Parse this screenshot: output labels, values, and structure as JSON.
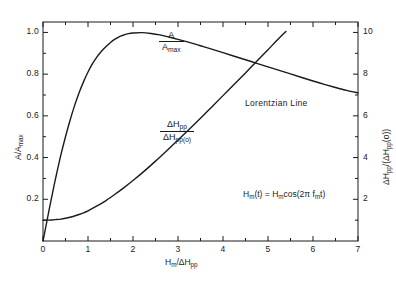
{
  "figure": {
    "background_color": "#ffffff",
    "line_color": "#1a1a1a",
    "annotation_note": "Lorentzian Line",
    "equation": {
      "lhs_symbol": "H",
      "lhs_sub": "m",
      "lhs_arg": "(t)",
      "equals": "=",
      "rhs_symbol": "H",
      "rhs_sub": "m",
      "rhs_fn": "cos(2π f",
      "rhs_fn_sub": "m",
      "rhs_tail": "t)",
      "full_text": "H_m(t) = H_m cos(2π f_m t)"
    },
    "axes": {
      "x": {
        "label_main": "H",
        "label_main_sub": "m",
        "label_sep": "/ΔH",
        "label_sep_sub": "pp",
        "label_full": "H_m /ΔH_pp",
        "ticks": [
          "0",
          "1",
          "2",
          "3",
          "4",
          "5",
          "6",
          "7"
        ]
      },
      "y_left": {
        "label_main": "A/A",
        "label_main_sub": "max",
        "label_full": "A/A_max",
        "ticks": [
          "0.2",
          "0.4",
          "0.6",
          "0.8",
          "1.0"
        ]
      },
      "y_right": {
        "label_num": "ΔH",
        "label_num_sub": "pp",
        "label_den": "/(ΔH",
        "label_den_sub": "pp",
        "label_tail": "(o))",
        "label_full": "ΔH_pp /(ΔH_pp(o))",
        "ticks": [
          "2",
          "4",
          "6",
          "8",
          "10"
        ]
      }
    },
    "curve_labels": {
      "amplitude": {
        "numerator": "A",
        "denominator_main": "A",
        "denominator_sub": "max",
        "full": "A/A_max"
      },
      "linewidth": {
        "numerator_main": "ΔH",
        "numerator_sub": "pp",
        "denominator_main": "ΔH",
        "denominator_sub": "pp",
        "denominator_tail": "(o)",
        "full": "ΔH_pp/ΔH_pp(o)"
      }
    }
  },
  "chart_data": {
    "type": "line",
    "title": "",
    "subtitle": "",
    "annotations": [
      "Lorentzian Line",
      "H_m(t) = H_m cos(2π f_m t)"
    ],
    "xlabel": "H_m /ΔH_pp",
    "ylabel": "A/A_max",
    "ylabel_secondary": "ΔH_pp /(ΔH_pp(o))",
    "xlim": [
      0,
      7
    ],
    "ylim": [
      0,
      1.05
    ],
    "ylim_secondary": [
      0,
      10.5
    ],
    "xticks": [
      0,
      1,
      2,
      3,
      4,
      5,
      6,
      7
    ],
    "yticks_left": [
      0.2,
      0.4,
      0.6,
      0.8,
      1.0
    ],
    "yticks_right": [
      2,
      4,
      6,
      8,
      10
    ],
    "minor_tick_interval_x": 0.5,
    "minor_tick_interval_y_left": 0.1,
    "minor_tick_interval_y_right": 1,
    "grid": false,
    "legend": "inline-curve-labels",
    "series": [
      {
        "name": "A/A_max",
        "axis": "left",
        "label_position": {
          "x": 3.05,
          "y": 0.93
        },
        "x": [
          0.0,
          0.05,
          0.1,
          0.15,
          0.2,
          0.25,
          0.3,
          0.4,
          0.5,
          0.6,
          0.7,
          0.8,
          0.9,
          1.0,
          1.1,
          1.2,
          1.3,
          1.4,
          1.5,
          1.6,
          1.7,
          1.8,
          1.9,
          2.0,
          2.2,
          2.4,
          2.6,
          2.8,
          3.0,
          3.25,
          3.5,
          3.75,
          4.0,
          4.25,
          4.5,
          4.75,
          5.0,
          5.25,
          5.5,
          5.75,
          6.0,
          6.25,
          6.5,
          6.75,
          7.0
        ],
        "y": [
          0.0,
          0.055,
          0.11,
          0.165,
          0.218,
          0.27,
          0.32,
          0.415,
          0.5,
          0.578,
          0.648,
          0.71,
          0.763,
          0.81,
          0.85,
          0.883,
          0.91,
          0.932,
          0.952,
          0.968,
          0.98,
          0.988,
          0.994,
          0.997,
          0.999,
          0.995,
          0.988,
          0.978,
          0.967,
          0.952,
          0.936,
          0.92,
          0.903,
          0.886,
          0.869,
          0.852,
          0.835,
          0.818,
          0.801,
          0.784,
          0.767,
          0.751,
          0.736,
          0.722,
          0.71
        ]
      },
      {
        "name": "ΔH_pp/ΔH_pp(o)",
        "axis": "right",
        "label_position": {
          "x": 2.45,
          "y": 4.4
        },
        "x": [
          0.0,
          0.05,
          0.1,
          0.2,
          0.3,
          0.4,
          0.5,
          0.6,
          0.7,
          0.8,
          0.9,
          1.0,
          1.2,
          1.4,
          1.6,
          1.8,
          2.0,
          2.25,
          2.5,
          2.75,
          3.0,
          3.25,
          3.5,
          3.75,
          4.0,
          4.25,
          4.5,
          4.75,
          5.0,
          5.2,
          5.4
        ],
        "y": [
          1.0,
          1.0,
          1.0,
          1.01,
          1.03,
          1.05,
          1.09,
          1.14,
          1.2,
          1.27,
          1.35,
          1.45,
          1.68,
          1.94,
          2.24,
          2.56,
          2.9,
          3.35,
          3.83,
          4.33,
          4.84,
          5.36,
          5.89,
          6.43,
          6.97,
          7.51,
          8.06,
          8.62,
          9.17,
          9.62,
          10.05
        ]
      }
    ]
  }
}
